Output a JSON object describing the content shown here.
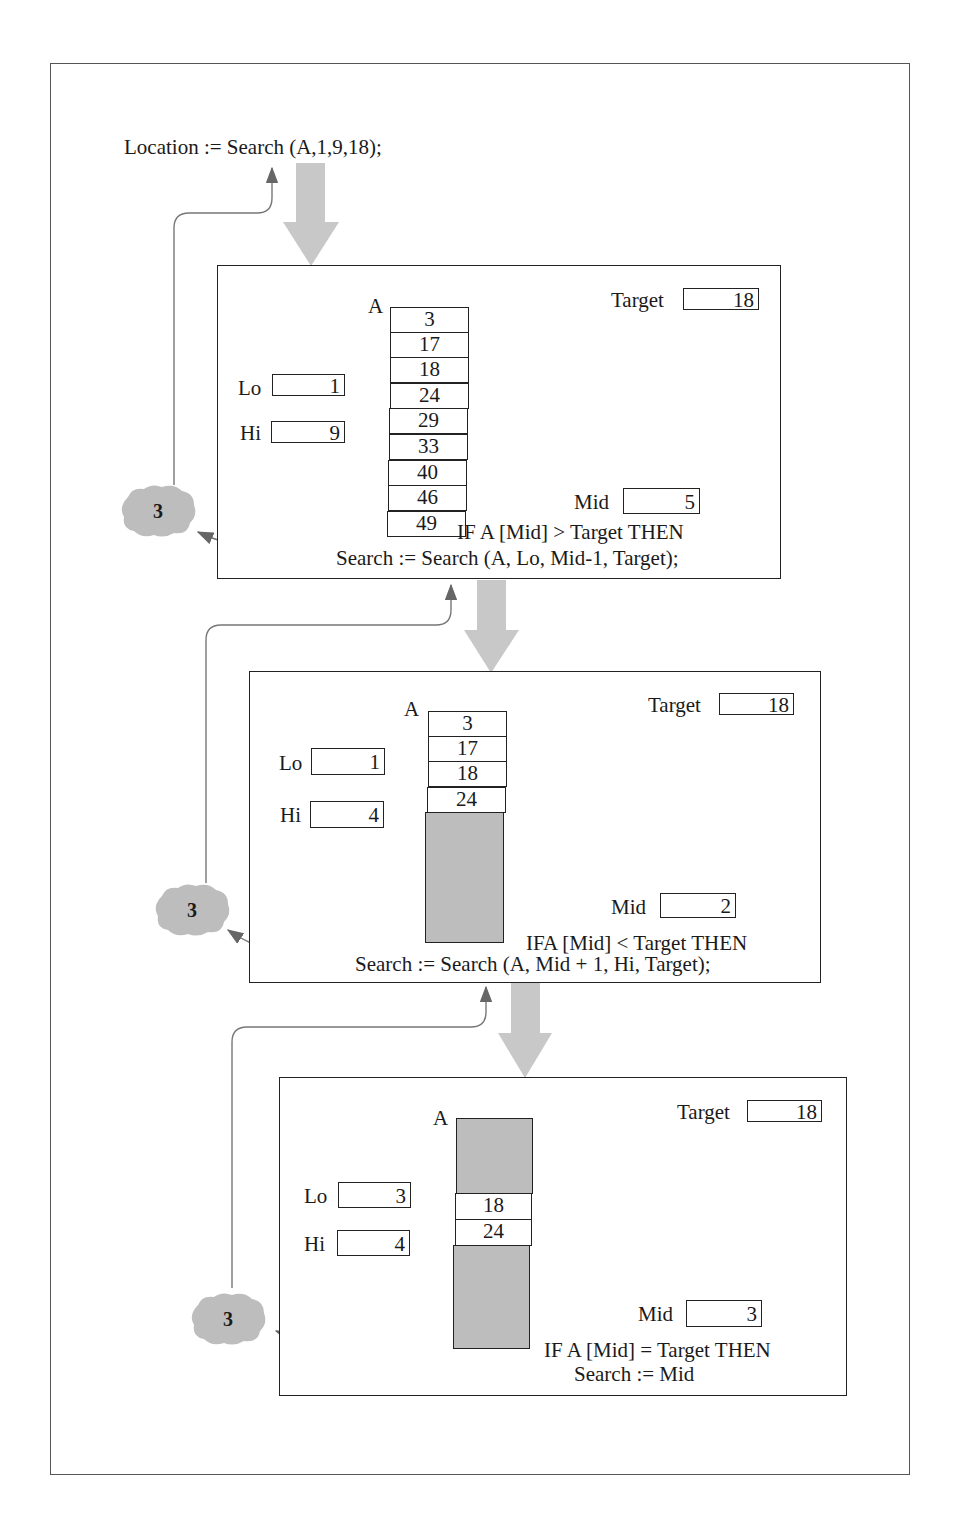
{
  "top_call": "Location  :=  Search (A,1,9,18);",
  "frames": [
    {
      "array_label": "A",
      "target_label": "Target",
      "target_value": "18",
      "lo_label": "Lo",
      "lo_value": "1",
      "hi_label": "Hi",
      "hi_value": "9",
      "mid_label": "Mid",
      "mid_value": "5",
      "cells": [
        "3",
        "17",
        "18",
        "24",
        "29",
        "33",
        "40",
        "46",
        "49"
      ],
      "condition": "IF A [Mid] > Target THEN",
      "statement": "Search  :=  Search (A, Lo, Mid-1, Target);",
      "return_value": "3"
    },
    {
      "array_label": "A",
      "target_label": "Target",
      "target_value": "18",
      "lo_label": "Lo",
      "lo_value": "1",
      "hi_label": "Hi",
      "hi_value": "4",
      "mid_label": "Mid",
      "mid_value": "2",
      "cells": [
        "3",
        "17",
        "18",
        "24"
      ],
      "condition": "IFA [Mid] < Target THEN",
      "statement": "Search  :=  Search (A, Mid + 1, Hi, Target);",
      "return_value": "3"
    },
    {
      "array_label": "A",
      "target_label": "Target",
      "target_value": "18",
      "lo_label": "Lo",
      "lo_value": "3",
      "hi_label": "Hi",
      "hi_value": "4",
      "mid_label": "Mid",
      "mid_value": "3",
      "cells": [
        "18",
        "24"
      ],
      "condition": "IF A [Mid]  =  Target THEN",
      "statement": "Search  :=  Mid",
      "return_value": "3"
    }
  ],
  "colors": {
    "flow_arrow": "#c8c8c8",
    "shaded": "#bdbdbd",
    "return_line": "#777777",
    "ink": "#1a1a1a"
  }
}
